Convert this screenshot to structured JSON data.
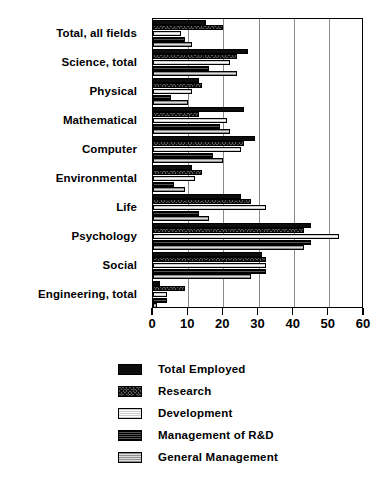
{
  "chart_data": {
    "type": "bar",
    "orientation": "horizontal",
    "title": "",
    "xlabel": "",
    "ylabel": "",
    "xlim": [
      0,
      60
    ],
    "xticks": [
      0,
      10,
      20,
      30,
      40,
      50,
      60
    ],
    "grid": true,
    "grid_axis": "x",
    "legend_position": "bottom",
    "categories": [
      "Total, all fields",
      "Science, total",
      "Physical",
      "Mathematical",
      "Computer",
      "Environmental",
      "Life",
      "Psychology",
      "Social",
      "Engineering, total"
    ],
    "series": [
      {
        "name": "Total Employed",
        "pattern": "solid-black",
        "color": "#0d0d0d",
        "values": [
          15,
          27,
          13,
          26,
          29,
          11,
          25,
          45,
          31,
          2
        ]
      },
      {
        "name": "Research",
        "pattern": "dark-crosshatch",
        "color": "#5a5a5a",
        "values": [
          20,
          24,
          14,
          13,
          26,
          14,
          28,
          43,
          32,
          9
        ]
      },
      {
        "name": "Development",
        "pattern": "light-stipple",
        "color": "#f2f2f2",
        "values": [
          8,
          22,
          11,
          21,
          25,
          12,
          32,
          53,
          32,
          4
        ]
      },
      {
        "name": "Management of R&D",
        "pattern": "dark-horizontal-lines",
        "color": "#2a2a2a",
        "values": [
          9,
          16,
          5,
          19,
          17,
          6,
          13,
          45,
          32,
          4
        ]
      },
      {
        "name": "General Management",
        "pattern": "medium-gray-stipple",
        "color": "#b9b9b9",
        "values": [
          11,
          24,
          10,
          22,
          20,
          9,
          16,
          43,
          28,
          1
        ]
      }
    ]
  },
  "axis": {
    "tick_labels": [
      "0",
      "10",
      "20",
      "30",
      "40",
      "50",
      "60"
    ]
  },
  "legend": {
    "items": [
      {
        "label": "Total Employed",
        "swatch": "solid-black-swatch"
      },
      {
        "label": "Research",
        "swatch": "crosshatch-swatch"
      },
      {
        "label": "Development",
        "swatch": "light-swatch"
      },
      {
        "label": "Management of R&D",
        "swatch": "dark-lines-swatch"
      },
      {
        "label": "General Management",
        "swatch": "gray-swatch"
      }
    ]
  }
}
